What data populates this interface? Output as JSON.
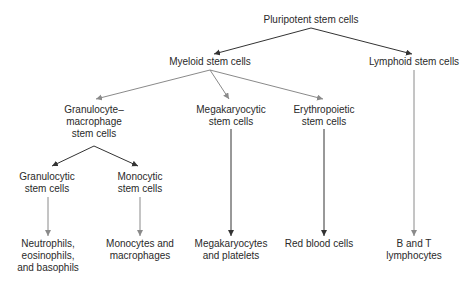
{
  "nodes": {
    "pluripotent": "Pluripotent stem cells",
    "myeloid": "Myeloid stem cells",
    "lymphoid": "Lymphoid stem cells",
    "gm_1": "Granulocyte–",
    "gm_2": "macrophage",
    "gm_3": "stem cells",
    "mega_1": "Megakaryocytic",
    "mega_2": "stem cells",
    "ery_1": "Erythropoietic",
    "ery_2": "stem cells",
    "gran_1": "Granulocytic",
    "gran_2": "stem cells",
    "mono_1": "Monocytic",
    "mono_2": "stem cells",
    "neut_1": "Neutrophils,",
    "neut_2": "eosinophils,",
    "neut_3": "and basophils",
    "monomac_1": "Monocytes and",
    "monomac_2": "macrophages",
    "megaplat_1": "Megakaryocytes",
    "megaplat_2": "and platelets",
    "rbc": "Red blood cells",
    "bt_1": "B and T",
    "bt_2": "lymphocytes"
  },
  "colors": {
    "dark_arrow": "#333333",
    "light_arrow": "#8a8a8a",
    "text": "#2a2a2a"
  }
}
